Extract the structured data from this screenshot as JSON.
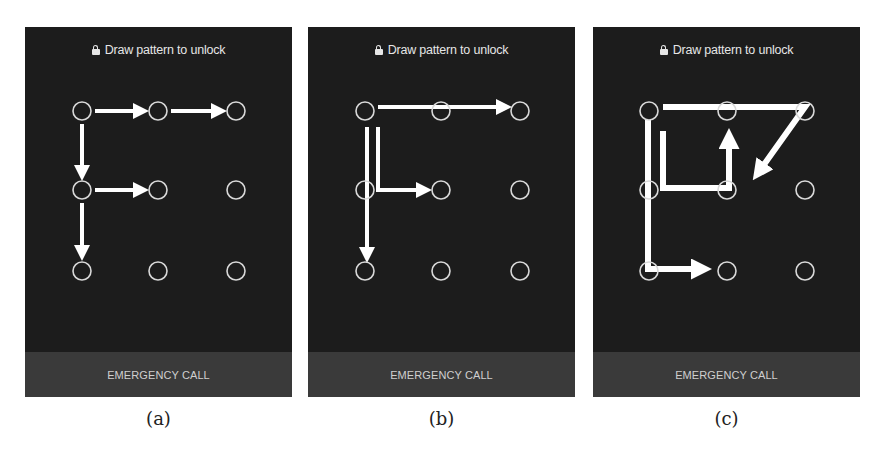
{
  "figure": {
    "panels": [
      {
        "id": "a",
        "caption": "(a)",
        "title": "Draw pattern to unlock",
        "lock_icon": "lock-icon",
        "emergency_label": "EMERGENCY CALL",
        "dots": {
          "cols": [
            57,
            133,
            211
          ],
          "rows": [
            84,
            163,
            244
          ],
          "radius": 9
        },
        "pattern_letter": "F",
        "arrows": [
          {
            "from": [
              0,
              0
            ],
            "to": [
              1,
              0
            ]
          },
          {
            "from": [
              1,
              0
            ],
            "to": [
              2,
              0
            ]
          },
          {
            "from": [
              0,
              0
            ],
            "to": [
              0,
              1
            ]
          },
          {
            "from": [
              0,
              1
            ],
            "to": [
              1,
              1
            ]
          },
          {
            "from": [
              0,
              1
            ],
            "to": [
              0,
              2
            ]
          }
        ]
      },
      {
        "id": "b",
        "caption": "(b)",
        "title": "Draw pattern to unlock",
        "lock_icon": "lock-icon",
        "emergency_label": "EMERGENCY CALL",
        "dots": {
          "cols": [
            57,
            133,
            212
          ],
          "rows": [
            84,
            163,
            244
          ],
          "radius": 9
        },
        "pattern_letter": "F",
        "arrows": [
          {
            "from": [
              0,
              0
            ],
            "to": [
              2,
              0
            ]
          },
          {
            "from": [
              0,
              0
            ],
            "to": [
              0,
              2
            ]
          },
          {
            "from": [
              0,
              0
            ],
            "to": [
              1,
              1
            ],
            "via": "L"
          }
        ]
      },
      {
        "id": "c",
        "caption": "(c)",
        "title": "Draw pattern to unlock",
        "lock_icon": "lock-icon",
        "emergency_label": "EMERGENCY CALL",
        "dots": {
          "cols": [
            56,
            134,
            212
          ],
          "rows": [
            84,
            163,
            244
          ],
          "radius": 9
        },
        "pattern_letter": "complex",
        "arrows": [
          {
            "from": [
              0,
              0
            ],
            "to": [
              2,
              0
            ],
            "head": false
          },
          {
            "from": [
              2,
              0
            ],
            "to": [
              1,
              1
            ],
            "head": true
          },
          {
            "from": [
              0,
              0
            ],
            "to": [
              0,
              2
            ],
            "head": false
          },
          {
            "from": [
              0,
              2
            ],
            "to": [
              1,
              2
            ],
            "head": true
          },
          {
            "from": [
              0,
              0
            ],
            "to": [
              1,
              1
            ],
            "via": "L"
          },
          {
            "from": [
              1,
              1
            ],
            "to": [
              1,
              0
            ],
            "head": true
          }
        ]
      }
    ]
  },
  "colors": {
    "panel_bg": "#1c1c1c",
    "emergency_bg": "#3a3a3a",
    "dot_stroke": "#d9d9d9",
    "arrow": "#ffffff",
    "text": "#e6e6e6"
  }
}
